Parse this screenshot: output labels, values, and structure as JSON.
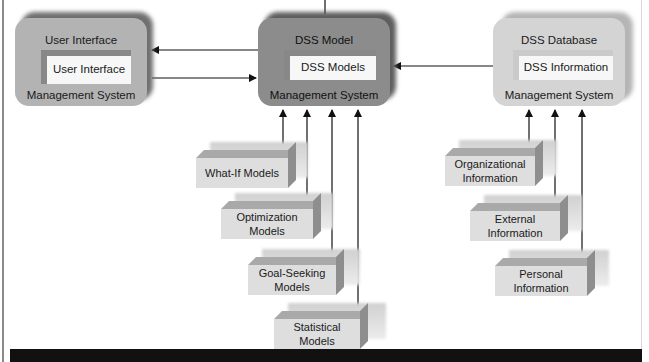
{
  "diagram": {
    "type": "DSS architecture",
    "systems": {
      "user_interface": {
        "title": "User Interface",
        "inner": "User Interface",
        "footer": "Management System"
      },
      "model": {
        "title": "DSS Model",
        "inner": "DSS Models",
        "footer": "Management System"
      },
      "database": {
        "title": "DSS Database",
        "inner": "DSS Information",
        "footer": "Management System"
      }
    },
    "models": [
      {
        "label": "What-If Models"
      },
      {
        "label": "Optimization Models"
      },
      {
        "label": "Goal-Seeking Models"
      },
      {
        "label": "Statistical Models"
      }
    ],
    "information_sources": [
      {
        "label": "Organizational Information"
      },
      {
        "label": "External Information"
      },
      {
        "label": "Personal Information"
      }
    ],
    "connections": [
      {
        "from": "DSS Model",
        "to": "User Interface"
      },
      {
        "from": "User Interface",
        "to": "DSS Model"
      },
      {
        "from": "DSS Database",
        "to": "DSS Model"
      },
      {
        "from": "What-If Models",
        "to": "DSS Model"
      },
      {
        "from": "Optimization Models",
        "to": "DSS Model"
      },
      {
        "from": "Goal-Seeking Models",
        "to": "DSS Model"
      },
      {
        "from": "Statistical Models",
        "to": "DSS Model"
      },
      {
        "from": "Organizational Information",
        "to": "DSS Database"
      },
      {
        "from": "External Information",
        "to": "DSS Database"
      },
      {
        "from": "Personal Information",
        "to": "DSS Database"
      }
    ]
  },
  "colors": {
    "ui_body": "#b3b3b3",
    "ui_shadow": "#6f6f6f",
    "model_body": "#8c8c8c",
    "model_shadow": "#5e5e5e",
    "db_body": "#d4d4d4",
    "db_shadow": "#b0b0b0",
    "line": "#111111"
  }
}
